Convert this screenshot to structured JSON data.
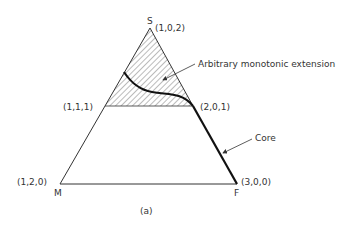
{
  "figure": {
    "caption": "(a)",
    "vertices": {
      "top": {
        "letter": "S",
        "coords": "(1,0,2)"
      },
      "bottom_left": {
        "letter": "M",
        "coords": "(1,2,0)"
      },
      "bottom_right": {
        "letter": "F",
        "coords": "(3,0,0)"
      }
    },
    "mid_points": {
      "left": "(1,1,1)",
      "right": "(2,0,1)"
    },
    "annotations": {
      "extension": "Arbitrary monotonic extension",
      "core": "Core"
    },
    "colors": {
      "line": "#333333",
      "hatch": "#555555",
      "background": "#ffffff"
    }
  }
}
